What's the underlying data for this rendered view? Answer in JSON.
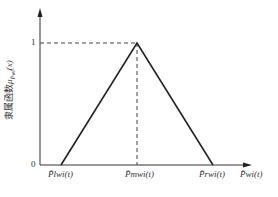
{
  "diagram": {
    "type": "triangular-membership-function",
    "y_axis": {
      "label_prefix": "隶属函数",
      "label_symbol": "μ",
      "label_sub": "P̃wi",
      "label_arg": "(x)",
      "ticks": [
        {
          "label": "1",
          "value": 1
        },
        {
          "label": "0",
          "value": 0
        }
      ]
    },
    "x_axis": {
      "label": "P̃wi(t)",
      "points": [
        {
          "name": "left",
          "label": "P̃lwi(t)"
        },
        {
          "name": "mid",
          "label": "P̃mwi(t)"
        },
        {
          "name": "right",
          "label": "P̃rwi(t)"
        }
      ]
    },
    "colors": {
      "line": "#222222",
      "dashed": "#444444"
    }
  }
}
